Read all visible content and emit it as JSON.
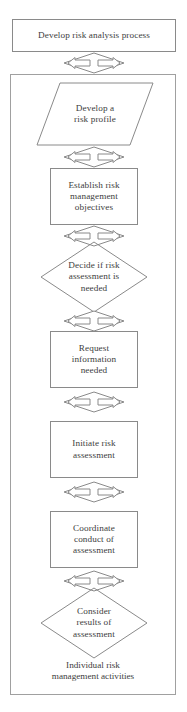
{
  "diagram": {
    "background_color": "#ffffff",
    "stroke_color": "#8a8a8a",
    "text_color": "#3d3d3d",
    "nodes": {
      "develop_process": {
        "label": "Develop risk analysis process",
        "shape": "rectangle"
      },
      "develop_profile": {
        "label": "Develop a\nrisk profile",
        "shape": "parallelogram"
      },
      "establish_objectives": {
        "label": "Establish risk\nmanagement\nobjectives",
        "shape": "rectangle"
      },
      "decide_assessment": {
        "label": "Decide if risk\nassessment is\nneeded",
        "shape": "diamond"
      },
      "request_information": {
        "label": "Request\ninformation\nneeded",
        "shape": "rectangle"
      },
      "initiate_assessment": {
        "label": "Initiate risk\nassessment",
        "shape": "rectangle"
      },
      "coordinate_assessment": {
        "label": "Coordinate\nconduct of\nassessment",
        "shape": "rectangle"
      },
      "consider_results": {
        "label": "Consider\nresults of\nassessment",
        "shape": "diamond"
      },
      "individual_activities": {
        "label": "Individual risk\nmanagement activities",
        "shape": "text"
      }
    },
    "connectors": [
      {
        "id": "connector-1",
        "from": "develop_process",
        "to": "develop_profile",
        "type": "bidirectional-arrow"
      },
      {
        "id": "connector-2",
        "from": "develop_profile",
        "to": "establish_objectives",
        "type": "bidirectional-arrow"
      },
      {
        "id": "connector-3",
        "from": "establish_objectives",
        "to": "decide_assessment",
        "type": "bidirectional-arrow"
      },
      {
        "id": "connector-4",
        "from": "decide_assessment",
        "to": "request_information",
        "type": "bidirectional-arrow"
      },
      {
        "id": "connector-5",
        "from": "request_information",
        "to": "initiate_assessment",
        "type": "bidirectional-arrow"
      },
      {
        "id": "connector-6",
        "from": "initiate_assessment",
        "to": "coordinate_assessment",
        "type": "bidirectional-arrow"
      },
      {
        "id": "connector-7",
        "from": "coordinate_assessment",
        "to": "consider_results",
        "type": "bidirectional-arrow"
      }
    ]
  }
}
